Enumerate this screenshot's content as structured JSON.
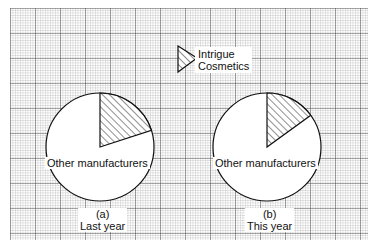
{
  "chart_data": {
    "type": "pie",
    "title": "",
    "legend": {
      "entries": [
        {
          "label_line1": "Intrigue",
          "label_line2": "Cosmetics",
          "pattern": "hatched"
        }
      ],
      "position": "top-center"
    },
    "charts": [
      {
        "id": "a",
        "caption_letter": "(a)",
        "caption": "Last year",
        "slices": [
          {
            "label": "Intrigue Cosmetics",
            "value": 20,
            "pattern": "hatched"
          },
          {
            "label": "Other manufacturers",
            "value": 80,
            "pattern": "plain"
          }
        ]
      },
      {
        "id": "b",
        "caption_letter": "(b)",
        "caption": "This year",
        "slices": [
          {
            "label": "Intrigue Cosmetics",
            "value": 15,
            "pattern": "hatched"
          },
          {
            "label": "Other manufacturers",
            "value": 85,
            "pattern": "plain"
          }
        ]
      }
    ],
    "background": "graph-paper grid"
  },
  "labels": {
    "legend_line1": "Intrigue",
    "legend_line2": "Cosmetics",
    "pie_a_other": "Other manufacturers",
    "pie_b_other": "Other manufacturers",
    "caption_a_letter": "(a)",
    "caption_a_text": "Last year",
    "caption_b_letter": "(b)",
    "caption_b_text": "This year"
  }
}
